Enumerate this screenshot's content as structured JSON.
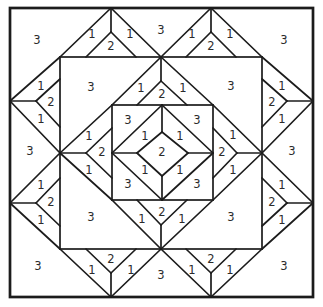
{
  "figure": {
    "canvas": {
      "w": 323,
      "h": 307
    },
    "background": "#ffffff",
    "ink": "#1c1c1c",
    "label_color": "#2b2b2b",
    "label_font_size": 11.5,
    "border": {
      "x": 10,
      "y": 8,
      "w": 303,
      "h": 289,
      "stroke_width": 2.7
    },
    "line_stroke_width": 1.7,
    "rects": [
      {
        "name": "mid-square",
        "x": 60,
        "y": 57,
        "w": 202,
        "h": 192
      },
      {
        "name": "inner-square",
        "x": 112,
        "y": 105,
        "w": 101,
        "h": 95
      }
    ],
    "segments": [
      [
        10,
        101,
        60,
        57
      ],
      [
        60,
        57,
        111,
        8
      ],
      [
        111,
        8,
        161,
        57
      ],
      [
        161,
        57,
        211,
        8
      ],
      [
        211,
        8,
        262,
        57
      ],
      [
        262,
        57,
        313,
        101
      ],
      [
        313,
        101,
        262,
        153
      ],
      [
        262,
        153,
        313,
        203
      ],
      [
        313,
        203,
        262,
        249
      ],
      [
        262,
        249,
        211,
        297
      ],
      [
        211,
        297,
        161,
        249
      ],
      [
        161,
        249,
        111,
        297
      ],
      [
        111,
        297,
        60,
        249
      ],
      [
        60,
        249,
        10,
        203
      ],
      [
        10,
        203,
        60,
        153
      ],
      [
        60,
        153,
        10,
        101
      ],
      [
        60,
        153,
        112,
        105
      ],
      [
        112,
        105,
        161,
        57
      ],
      [
        161,
        57,
        213,
        105
      ],
      [
        213,
        105,
        262,
        153
      ],
      [
        262,
        153,
        213,
        200
      ],
      [
        213,
        200,
        161,
        249
      ],
      [
        161,
        249,
        112,
        200
      ],
      [
        112,
        200,
        60,
        153
      ],
      [
        162,
        105,
        213,
        153
      ],
      [
        213,
        153,
        162,
        200
      ],
      [
        162,
        200,
        112,
        153
      ],
      [
        112,
        153,
        162,
        105
      ],
      [
        162,
        132,
        188,
        153
      ],
      [
        188,
        153,
        162,
        176
      ],
      [
        162,
        176,
        137,
        153
      ],
      [
        137,
        153,
        162,
        132
      ],
      [
        162,
        105,
        162,
        132
      ],
      [
        213,
        153,
        188,
        153
      ],
      [
        162,
        200,
        162,
        176
      ],
      [
        112,
        153,
        137,
        153
      ],
      [
        111,
        8,
        111,
        32
      ],
      [
        111,
        32,
        86,
        57
      ],
      [
        111,
        32,
        136,
        57
      ],
      [
        211,
        8,
        211,
        32
      ],
      [
        211,
        32,
        186,
        57
      ],
      [
        211,
        32,
        236,
        57
      ],
      [
        111,
        297,
        111,
        273
      ],
      [
        111,
        273,
        86,
        249
      ],
      [
        111,
        273,
        136,
        249
      ],
      [
        211,
        297,
        211,
        273
      ],
      [
        211,
        273,
        186,
        249
      ],
      [
        211,
        273,
        236,
        249
      ],
      [
        10,
        101,
        36,
        101
      ],
      [
        36,
        101,
        60,
        79
      ],
      [
        36,
        101,
        60,
        127
      ],
      [
        10,
        203,
        36,
        203
      ],
      [
        36,
        203,
        60,
        178
      ],
      [
        36,
        203,
        60,
        226
      ],
      [
        313,
        101,
        287,
        101
      ],
      [
        287,
        101,
        262,
        79
      ],
      [
        287,
        101,
        262,
        127
      ],
      [
        313,
        203,
        287,
        203
      ],
      [
        287,
        203,
        262,
        178
      ],
      [
        287,
        203,
        262,
        226
      ],
      [
        161,
        57,
        161,
        81
      ],
      [
        161,
        81,
        137,
        105
      ],
      [
        161,
        81,
        187,
        105
      ],
      [
        161,
        249,
        161,
        225
      ],
      [
        161,
        225,
        137,
        200
      ],
      [
        161,
        225,
        187,
        200
      ],
      [
        60,
        153,
        86,
        153
      ],
      [
        86,
        153,
        112,
        128
      ],
      [
        86,
        153,
        112,
        178
      ],
      [
        262,
        153,
        237,
        153
      ],
      [
        237,
        153,
        213,
        128
      ],
      [
        237,
        153,
        213,
        178
      ]
    ],
    "labels": [
      {
        "t": "3",
        "x": 37,
        "y": 40
      },
      {
        "t": "3",
        "x": 284,
        "y": 40
      },
      {
        "t": "3",
        "x": 38,
        "y": 266
      },
      {
        "t": "3",
        "x": 284,
        "y": 266
      },
      {
        "t": "3",
        "x": 161,
        "y": 30
      },
      {
        "t": "3",
        "x": 161,
        "y": 275
      },
      {
        "t": "3",
        "x": 30,
        "y": 151
      },
      {
        "t": "3",
        "x": 292,
        "y": 151
      },
      {
        "t": "1",
        "x": 92,
        "y": 34
      },
      {
        "t": "2",
        "x": 111,
        "y": 46
      },
      {
        "t": "1",
        "x": 130,
        "y": 34
      },
      {
        "t": "1",
        "x": 192,
        "y": 34
      },
      {
        "t": "2",
        "x": 211,
        "y": 46
      },
      {
        "t": "1",
        "x": 230,
        "y": 34
      },
      {
        "t": "1",
        "x": 92,
        "y": 270
      },
      {
        "t": "2",
        "x": 111,
        "y": 259
      },
      {
        "t": "1",
        "x": 131,
        "y": 270
      },
      {
        "t": "1",
        "x": 192,
        "y": 270
      },
      {
        "t": "2",
        "x": 211,
        "y": 259
      },
      {
        "t": "1",
        "x": 230,
        "y": 270
      },
      {
        "t": "1",
        "x": 41,
        "y": 86
      },
      {
        "t": "2",
        "x": 51,
        "y": 102
      },
      {
        "t": "1",
        "x": 41,
        "y": 119
      },
      {
        "t": "1",
        "x": 41,
        "y": 185
      },
      {
        "t": "2",
        "x": 51,
        "y": 202
      },
      {
        "t": "1",
        "x": 41,
        "y": 220
      },
      {
        "t": "1",
        "x": 282,
        "y": 86
      },
      {
        "t": "2",
        "x": 272,
        "y": 102
      },
      {
        "t": "1",
        "x": 282,
        "y": 119
      },
      {
        "t": "1",
        "x": 282,
        "y": 185
      },
      {
        "t": "2",
        "x": 272,
        "y": 202
      },
      {
        "t": "1",
        "x": 282,
        "y": 220
      },
      {
        "t": "3",
        "x": 91,
        "y": 87
      },
      {
        "t": "3",
        "x": 231,
        "y": 86
      },
      {
        "t": "3",
        "x": 91,
        "y": 217
      },
      {
        "t": "3",
        "x": 231,
        "y": 217
      },
      {
        "t": "1",
        "x": 141,
        "y": 88
      },
      {
        "t": "2",
        "x": 162,
        "y": 94
      },
      {
        "t": "1",
        "x": 183,
        "y": 88
      },
      {
        "t": "1",
        "x": 142,
        "y": 219
      },
      {
        "t": "2",
        "x": 162,
        "y": 212
      },
      {
        "t": "1",
        "x": 182,
        "y": 219
      },
      {
        "t": "1",
        "x": 89,
        "y": 136
      },
      {
        "t": "2",
        "x": 102,
        "y": 152
      },
      {
        "t": "1",
        "x": 89,
        "y": 170
      },
      {
        "t": "1",
        "x": 233,
        "y": 135
      },
      {
        "t": "2",
        "x": 222,
        "y": 152
      },
      {
        "t": "1",
        "x": 233,
        "y": 170
      },
      {
        "t": "3",
        "x": 128,
        "y": 120
      },
      {
        "t": "3",
        "x": 197,
        "y": 120
      },
      {
        "t": "3",
        "x": 128,
        "y": 184
      },
      {
        "t": "3",
        "x": 197,
        "y": 184
      },
      {
        "t": "1",
        "x": 145,
        "y": 136
      },
      {
        "t": "1",
        "x": 180,
        "y": 136
      },
      {
        "t": "1",
        "x": 145,
        "y": 170
      },
      {
        "t": "1",
        "x": 180,
        "y": 170
      },
      {
        "t": "2",
        "x": 162,
        "y": 152
      }
    ]
  }
}
